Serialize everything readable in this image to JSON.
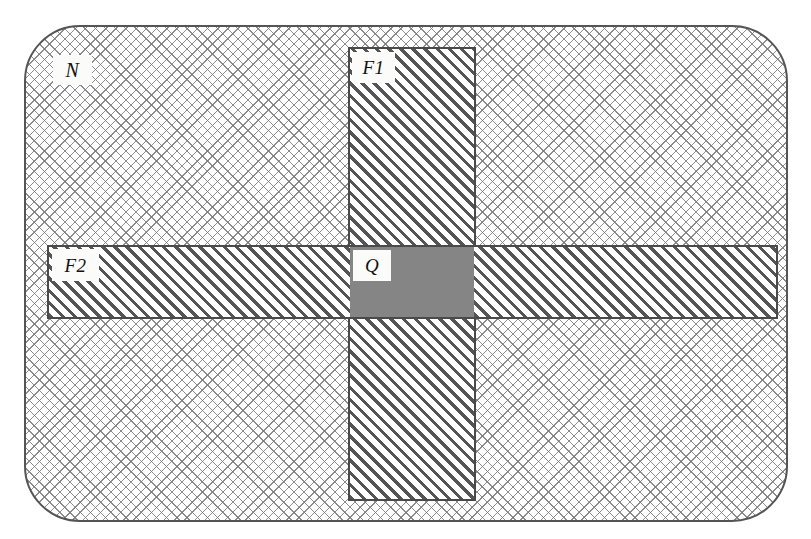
{
  "figure": {
    "width": 811,
    "height": 539,
    "background_color": "#ffffff"
  },
  "regions": [
    {
      "id": "N",
      "label": "N",
      "shape": "rounded-rectangle",
      "fill": "cross-hatch",
      "fill_color": "#787878",
      "outline_color": "#555555",
      "description": "Outer bounding region with cross-hatch fill"
    },
    {
      "id": "F1",
      "label": "F1",
      "shape": "rectangle",
      "orientation": "vertical",
      "fill": "diagonal-hatch",
      "fill_color": "#464646",
      "outline_color": "#4a4a4a",
      "description": "Vertical band with diagonal hatch fill"
    },
    {
      "id": "F2",
      "label": "F2",
      "shape": "rectangle",
      "orientation": "horizontal",
      "fill": "diagonal-hatch",
      "fill_color": "#464646",
      "outline_color": "#4a4a4a",
      "description": "Horizontal band with diagonal hatch fill"
    },
    {
      "id": "Q",
      "label": "Q",
      "shape": "rectangle",
      "fill": "solid",
      "fill_color": "#858585",
      "description": "Intersection of F1 and F2, solid grey fill"
    }
  ],
  "labels": {
    "n": "N",
    "f1": "F1",
    "f2": "F2",
    "q": "Q"
  }
}
